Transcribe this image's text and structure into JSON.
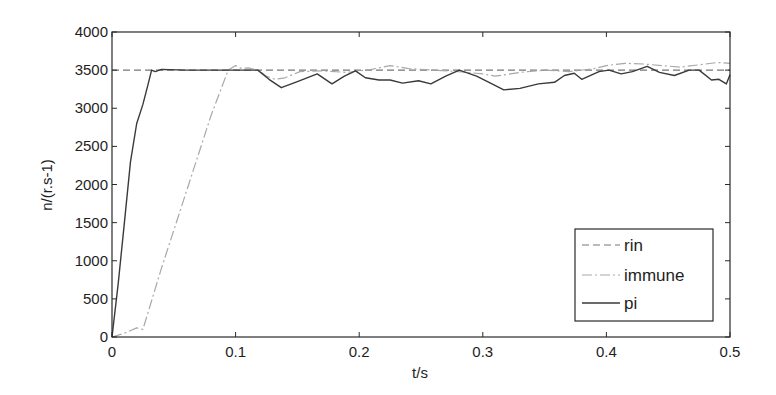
{
  "chart_data": {
    "type": "line",
    "title": "",
    "xlabel": "t/s",
    "ylabel": "n/(r.s-1)",
    "xlim": [
      0,
      0.5
    ],
    "ylim": [
      0,
      4000
    ],
    "grid": false,
    "legend_position": "lower right",
    "x_ticks": [
      0,
      0.1,
      0.2,
      0.3,
      0.4,
      0.5
    ],
    "x_tick_labels": [
      "0",
      "0.1",
      "0.2",
      "0.3",
      "0.4",
      "0.5"
    ],
    "y_ticks": [
      0,
      500,
      1000,
      1500,
      2000,
      2500,
      3000,
      3500,
      4000
    ],
    "y_tick_labels": [
      "0",
      "500",
      "1000",
      "1500",
      "2000",
      "2500",
      "3000",
      "3500",
      "4000"
    ],
    "series": [
      {
        "name": "rin",
        "style": "dashed",
        "color": "#777777",
        "x": [
          0,
          0.5
        ],
        "y": [
          3500,
          3500
        ]
      },
      {
        "name": "immune",
        "style": "dashdot",
        "color": "#a8a8a8",
        "x": [
          0,
          0.01,
          0.02,
          0.025,
          0.04,
          0.06,
          0.08,
          0.094,
          0.1,
          0.105,
          0.11,
          0.118,
          0.125,
          0.132,
          0.14,
          0.152,
          0.17,
          0.19,
          0.21,
          0.225,
          0.24,
          0.26,
          0.28,
          0.3,
          0.31,
          0.33,
          0.35,
          0.37,
          0.39,
          0.4,
          0.415,
          0.43,
          0.445,
          0.46,
          0.475,
          0.49,
          0.5
        ],
        "y": [
          0,
          50,
          120,
          100,
          900,
          1900,
          2900,
          3500,
          3560,
          3520,
          3530,
          3500,
          3420,
          3380,
          3400,
          3480,
          3490,
          3470,
          3510,
          3560,
          3520,
          3500,
          3480,
          3450,
          3420,
          3470,
          3500,
          3480,
          3520,
          3560,
          3590,
          3580,
          3560,
          3540,
          3570,
          3600,
          3590
        ]
      },
      {
        "name": "pi",
        "style": "solid",
        "color": "#3a3a3a",
        "x": [
          0,
          0.005,
          0.01,
          0.015,
          0.02,
          0.025,
          0.029,
          0.032,
          0.035,
          0.04,
          0.06,
          0.08,
          0.1,
          0.118,
          0.127,
          0.137,
          0.15,
          0.166,
          0.178,
          0.188,
          0.197,
          0.205,
          0.216,
          0.225,
          0.235,
          0.248,
          0.258,
          0.27,
          0.281,
          0.295,
          0.305,
          0.317,
          0.33,
          0.345,
          0.358,
          0.366,
          0.374,
          0.38,
          0.394,
          0.402,
          0.412,
          0.421,
          0.433,
          0.443,
          0.455,
          0.467,
          0.475,
          0.485,
          0.491,
          0.497,
          0.5
        ],
        "y": [
          0,
          700,
          1500,
          2300,
          2800,
          3050,
          3300,
          3500,
          3480,
          3510,
          3500,
          3500,
          3500,
          3500,
          3380,
          3270,
          3350,
          3450,
          3320,
          3420,
          3490,
          3400,
          3370,
          3370,
          3330,
          3360,
          3320,
          3420,
          3500,
          3420,
          3340,
          3240,
          3260,
          3320,
          3340,
          3430,
          3460,
          3380,
          3480,
          3500,
          3450,
          3480,
          3550,
          3470,
          3430,
          3500,
          3500,
          3370,
          3380,
          3320,
          3440
        ]
      }
    ]
  },
  "legend": {
    "items": [
      {
        "label": "rin"
      },
      {
        "label": "immune"
      },
      {
        "label": "pi"
      }
    ]
  }
}
